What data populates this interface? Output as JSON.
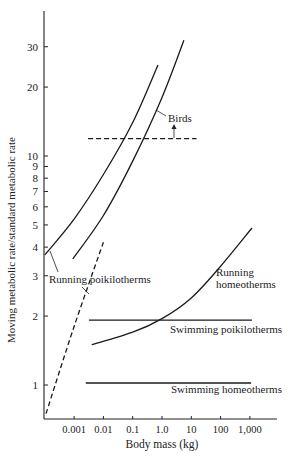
{
  "chart_data": {
    "type": "line",
    "title": "",
    "xlabel": "Body mass (kg)",
    "ylabel": "Moving metabolic rate/standard metabolic rate",
    "xscale": "log",
    "yscale": "log",
    "xlim": [
      0.0001,
      5000
    ],
    "ylim": [
      0.7,
      45
    ],
    "grid": false,
    "legend": "none (inline labels)",
    "x_ticks": [
      {
        "value": 0.001,
        "label": "0.001"
      },
      {
        "value": 0.01,
        "label": "0.01"
      },
      {
        "value": 0.1,
        "label": "0.1"
      },
      {
        "value": 1,
        "label": "1.0"
      },
      {
        "value": 10,
        "label": "10"
      },
      {
        "value": 100,
        "label": "100"
      },
      {
        "value": 1000,
        "label": "1,000"
      }
    ],
    "y_ticks": [
      {
        "value": 1,
        "label": "1"
      },
      {
        "value": 2,
        "label": "2"
      },
      {
        "value": 3,
        "label": "3"
      },
      {
        "value": 4,
        "label": "4"
      },
      {
        "value": 5,
        "label": "5"
      },
      {
        "value": 6,
        "label": "6"
      },
      {
        "value": 7,
        "label": "7"
      },
      {
        "value": 8,
        "label": "8"
      },
      {
        "value": 9,
        "label": "9"
      },
      {
        "value": 10,
        "label": "10"
      },
      {
        "value": 20,
        "label": "20"
      },
      {
        "value": 30,
        "label": "30"
      }
    ],
    "series": [
      {
        "name": "Running poikilotherms",
        "style": "solid",
        "x": [
          0.0001,
          0.001,
          0.01,
          0.1,
          0.73
        ],
        "y": [
          3.7,
          5.3,
          8.3,
          14,
          25
        ]
      },
      {
        "name": "Running poikilotherms (insects)",
        "style": "dashed",
        "x": [
          0.00011,
          0.001,
          0.01
        ],
        "y": [
          0.75,
          1.8,
          4.2
        ]
      },
      {
        "name": "Birds",
        "style": "solid",
        "x": [
          0.0009,
          0.01,
          0.1,
          1,
          5.6
        ],
        "y": [
          3.55,
          5.5,
          9.5,
          18,
          32
        ]
      },
      {
        "name": "Birds (threshold)",
        "style": "dashed",
        "x": [
          0.003,
          15
        ],
        "y": [
          11.9,
          11.9
        ]
      },
      {
        "name": "Running homeotherms",
        "style": "solid",
        "x": [
          0.004,
          0.1,
          1,
          10,
          100,
          1180
        ],
        "y": [
          1.5,
          1.7,
          1.95,
          2.4,
          3.3,
          4.85
        ]
      },
      {
        "name": "Swimming poikilotherms",
        "style": "solid",
        "x": [
          0.0032,
          1180
        ],
        "y": [
          1.92,
          1.92
        ]
      },
      {
        "name": "Swimming homeotherms",
        "style": "solid",
        "x": [
          0.0025,
          1100
        ],
        "y": [
          1.02,
          1.02
        ]
      }
    ],
    "annotations": [
      {
        "text": "Birds",
        "arrow": "up from dashed line to label"
      },
      {
        "text": "Running poikilotherms"
      },
      {
        "text": "Running"
      },
      {
        "text": "homeotherms"
      },
      {
        "text": "Swimming poikilotherms"
      },
      {
        "text": "Swimming homeotherms"
      }
    ]
  }
}
